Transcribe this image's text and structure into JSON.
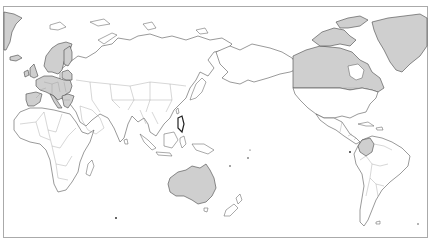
{
  "map": {
    "type": "choropleth-world-map",
    "projection": "pacific-centered",
    "colors": {
      "background": "#ffffff",
      "land": "#ffffff",
      "highlighted": "#cfcfcf",
      "outline": "#555555",
      "frame": "#aaaaaa"
    },
    "highlighted_regions": [
      "Greenland",
      "Iceland",
      "Norway",
      "Sweden",
      "Finland",
      "United Kingdom",
      "Ireland",
      "France",
      "Spain",
      "Portugal",
      "Germany",
      "Poland",
      "Italy",
      "Austria",
      "Czechia",
      "Hungary",
      "Romania",
      "Bulgaria",
      "Greece",
      "Baltic states",
      "Canada",
      "Australia",
      "Colombia"
    ],
    "unhighlighted_examples": [
      "Russia",
      "China",
      "India",
      "Africa",
      "Middle East",
      "Southeast Asia",
      "United States",
      "Mexico",
      "Brazil",
      "Argentina",
      "Chile",
      "New Zealand",
      "Japan"
    ]
  }
}
